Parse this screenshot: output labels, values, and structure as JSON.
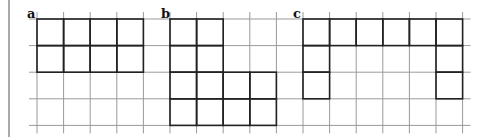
{
  "diagram": {
    "grid": {
      "origin_x": 37,
      "origin_y": 19,
      "cell": 26.6,
      "cols": 16,
      "rows": 4,
      "line_color": "#9a9a9a",
      "shape_color": "#222222"
    },
    "border_left_x": 9,
    "figures": [
      {
        "label": "a",
        "label_x": 27,
        "label_y": 7,
        "cells": [
          [
            0,
            0
          ],
          [
            1,
            0
          ],
          [
            2,
            0
          ],
          [
            3,
            0
          ],
          [
            0,
            1
          ],
          [
            1,
            1
          ],
          [
            2,
            1
          ],
          [
            3,
            1
          ]
        ]
      },
      {
        "label": "b",
        "label_x": 161,
        "label_y": 7,
        "cells": [
          [
            5,
            0
          ],
          [
            6,
            0
          ],
          [
            5,
            1
          ],
          [
            6,
            1
          ],
          [
            5,
            2
          ],
          [
            6,
            2
          ],
          [
            7,
            2
          ],
          [
            8,
            2
          ],
          [
            5,
            3
          ],
          [
            6,
            3
          ],
          [
            7,
            3
          ],
          [
            8,
            3
          ]
        ]
      },
      {
        "label": "c",
        "label_x": 293,
        "label_y": 7,
        "cells": [
          [
            10,
            0
          ],
          [
            11,
            0
          ],
          [
            12,
            0
          ],
          [
            13,
            0
          ],
          [
            14,
            0
          ],
          [
            15,
            0
          ],
          [
            10,
            1
          ],
          [
            15,
            1
          ],
          [
            10,
            2
          ],
          [
            15,
            2
          ]
        ]
      }
    ]
  }
}
